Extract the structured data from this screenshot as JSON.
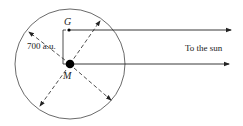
{
  "diagram": {
    "labels": {
      "point_g": "G",
      "point_m": "M",
      "distance": "700 a.u.",
      "direction": "To the sun"
    },
    "circle": {
      "cx": 70,
      "cy": 64,
      "r": 55
    },
    "colors": {
      "stroke": "#333333",
      "fill": "#000000",
      "background": "#ffffff"
    }
  }
}
